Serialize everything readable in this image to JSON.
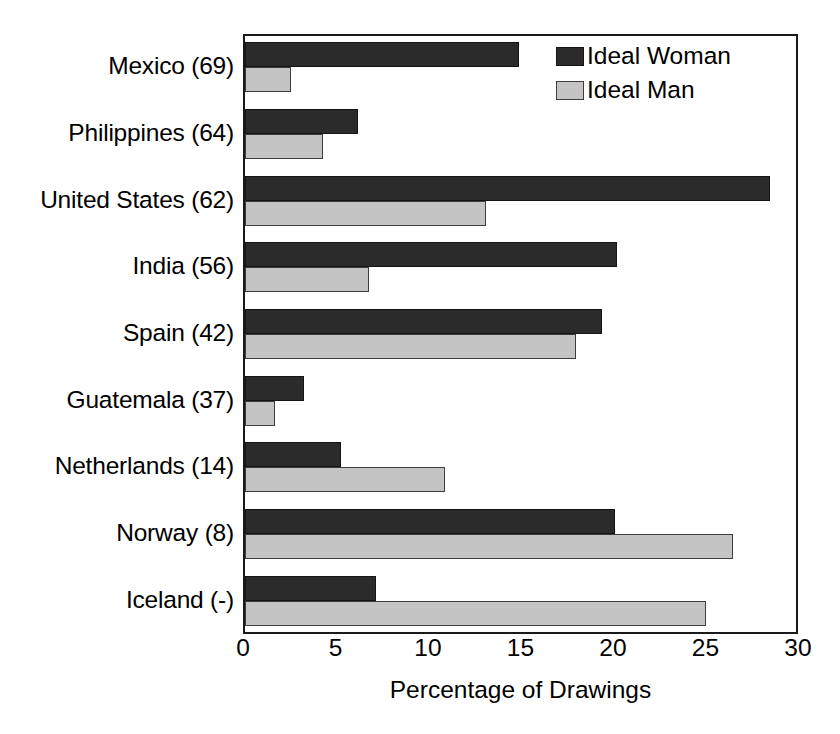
{
  "chart_data": {
    "type": "bar",
    "orientation": "horizontal",
    "title": "",
    "xlabel": "Percentage of Drawings",
    "ylabel": "",
    "xlim": [
      0,
      30
    ],
    "xticks": [
      0,
      5,
      10,
      15,
      20,
      25,
      30
    ],
    "grid": false,
    "legend_position": "top-right",
    "categories": [
      "Mexico (69)",
      "Philippines (64)",
      "United States (62)",
      "India (56)",
      "Spain (42)",
      "Guatemala (37)",
      "Netherlands (14)",
      "Norway (8)",
      "Iceland (-)"
    ],
    "series": [
      {
        "name": "Ideal Woman",
        "color": "#2b2b2b",
        "values": [
          14.8,
          6.1,
          28.4,
          20.1,
          19.3,
          3.2,
          5.2,
          20.0,
          7.1
        ]
      },
      {
        "name": "Ideal Man",
        "color": "#c4c4c4",
        "values": [
          2.5,
          4.2,
          13.0,
          6.7,
          17.9,
          1.6,
          10.8,
          26.4,
          24.9
        ]
      }
    ]
  },
  "axis": {
    "x_title": "Percentage of Drawings",
    "x_tick_labels": [
      "0",
      "5",
      "10",
      "15",
      "20",
      "25",
      "30"
    ]
  },
  "legend": {
    "items": [
      {
        "label": "Ideal Woman",
        "swatch": "dark-swatch"
      },
      {
        "label": "Ideal Man",
        "swatch": "light-swatch"
      }
    ]
  }
}
